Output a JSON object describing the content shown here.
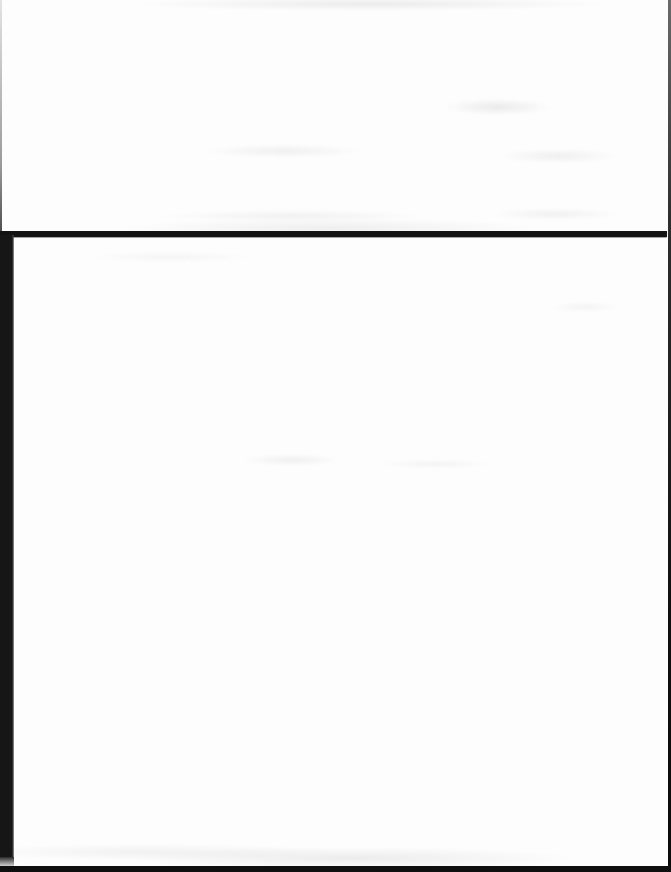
{
  "document": {
    "visible_text": ""
  },
  "colors": {
    "page_background": "#fdfdfd",
    "rule_ink": "#131313",
    "gutter_ink": "#161616",
    "right_edge": "#2e2e2e",
    "left_edge": "#9a9a9a",
    "bottom_edge": "#0f0f0f",
    "smudge": "#e4e4e4"
  }
}
